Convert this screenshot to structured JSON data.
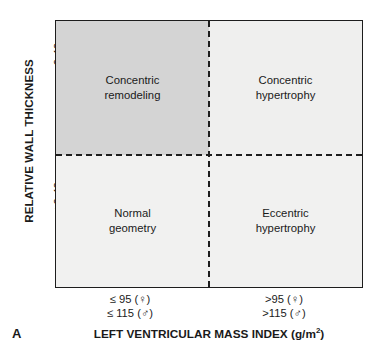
{
  "chart_data": {
    "type": "table",
    "panel_label": "A",
    "xlabel": "LEFT VENTRICULAR MASS INDEX (g/m",
    "xlabel_superscript": "2",
    "xlabel_suffix": ")",
    "ylabel": "RELATIVE WALL THICKNESS",
    "x_categories": [
      {
        "line1": "≤ 95 (♀)",
        "line2": "≤ 115 (♂)"
      },
      {
        "line1": ">95 (♀)",
        "line2": ">115 (♂)"
      }
    ],
    "y_categories": [
      {
        "label": "> 0.42"
      },
      {
        "label": "≤ 0.42"
      }
    ],
    "cells": [
      {
        "row": "> 0.42",
        "column": "≤ 95 (♀) / ≤ 115 (♂)",
        "line1": "Concentric",
        "line2": "remodeling",
        "fill": "#d4d4d4"
      },
      {
        "row": "> 0.42",
        "column": ">95 (♀) / >115 (♂)",
        "line1": "Concentric",
        "line2": "hypertrophy",
        "fill": "#efefee"
      },
      {
        "row": "≤ 0.42",
        "column": "≤ 95 (♀) / ≤ 115 (♂)",
        "line1": "Normal",
        "line2": "geometry",
        "fill": "#f1f1f0"
      },
      {
        "row": "≤ 0.42",
        "column": ">95 (♀) / >115 (♂)",
        "line1": "Eccentric",
        "line2": "hypertrophy",
        "fill": "#f1f1f0"
      }
    ],
    "grid": false,
    "legend": "none",
    "colors": {
      "frame": "#1d1d1d",
      "divider": "#1d1d1d",
      "shaded_cell": "#d4d4d4",
      "light_cell": "#f1f1f0",
      "text": "#1a1a1a",
      "background": "#ffffff"
    }
  }
}
